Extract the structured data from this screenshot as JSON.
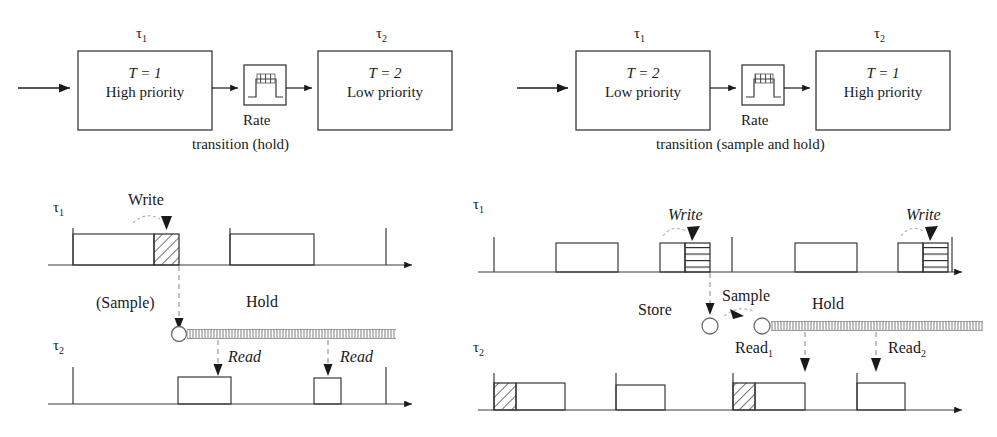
{
  "figure": {
    "type": "diagram",
    "panels": [
      {
        "id": "left-block-diagram",
        "caption_line1": "Rate",
        "caption_line2": "transition (hold)",
        "source_task_label": "τ",
        "source_task_sub": "1",
        "dest_task_label": "τ",
        "dest_task_sub": "2",
        "source_box": {
          "period_text": "T = 1",
          "priority_text": "High priority"
        },
        "dest_box": {
          "period_text": "T = 2",
          "priority_text": "Low priority"
        },
        "icon_name": "rate-transition-icon"
      },
      {
        "id": "right-block-diagram",
        "caption_line1": "Rate",
        "caption_line2": "transition (sample and hold)",
        "source_task_label": "τ",
        "source_task_sub": "1",
        "dest_task_label": "τ",
        "dest_task_sub": "2",
        "source_box": {
          "period_text": "T = 2",
          "priority_text": "Low priority"
        },
        "dest_box": {
          "period_text": "T = 1",
          "priority_text": "High priority"
        },
        "icon_name": "rate-transition-icon"
      }
    ],
    "timing_left": {
      "id": "left-timing-diagram",
      "row1_label": "τ",
      "row1_sub": "1",
      "row2_label": "τ",
      "row2_sub": "2",
      "annotations": {
        "write": "Write",
        "sample": "(Sample)",
        "hold": "Hold",
        "read1": "Read",
        "read2": "Read"
      }
    },
    "timing_right": {
      "id": "right-timing-diagram",
      "row1_label": "τ",
      "row1_sub": "1",
      "row2_label": "τ",
      "row2_sub": "2",
      "annotations": {
        "write1": "Write",
        "write2": "Write",
        "store": "Store",
        "sample": "Sample",
        "hold": "Hold",
        "read1": "Read",
        "read1_sub": "1",
        "read2": "Read",
        "read2_sub": "2"
      }
    },
    "colors": {
      "ink": "#1a1a1a",
      "line": "#333333",
      "dash": "#9a9a9a",
      "background": "#ffffff"
    }
  }
}
